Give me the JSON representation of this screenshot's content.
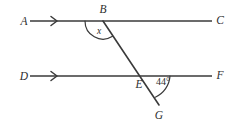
{
  "figure": {
    "background_color": "#ffffff",
    "stroke_color": "#3a3a3a",
    "text_color": "#2e2e2e"
  },
  "labels": {
    "a": "A",
    "b": "B",
    "c": "C",
    "d": "D",
    "e": "E",
    "f": "F",
    "g": "G"
  },
  "angles": {
    "unknown_label": "x",
    "known_value": "44°"
  },
  "markers": {
    "parallel_arrow": "single-chevron-right"
  },
  "geometry": {
    "line_top": {
      "label_start": "A",
      "label_end": "C",
      "y": 21,
      "x_start": 30,
      "x_end": 212
    },
    "line_bottom": {
      "label_start": "D",
      "label_end": "F",
      "y": 76,
      "x_start": 30,
      "x_end": 212
    },
    "transversal": {
      "from": "B",
      "through": "E",
      "to": "G",
      "x1": 103,
      "y1": 21,
      "x2": 159,
      "y2": 105
    },
    "vertex_b": {
      "x": 103,
      "y": 21
    },
    "vertex_e": {
      "x": 145,
      "y": 76
    },
    "vertex_g": {
      "x": 159,
      "y": 105
    }
  }
}
